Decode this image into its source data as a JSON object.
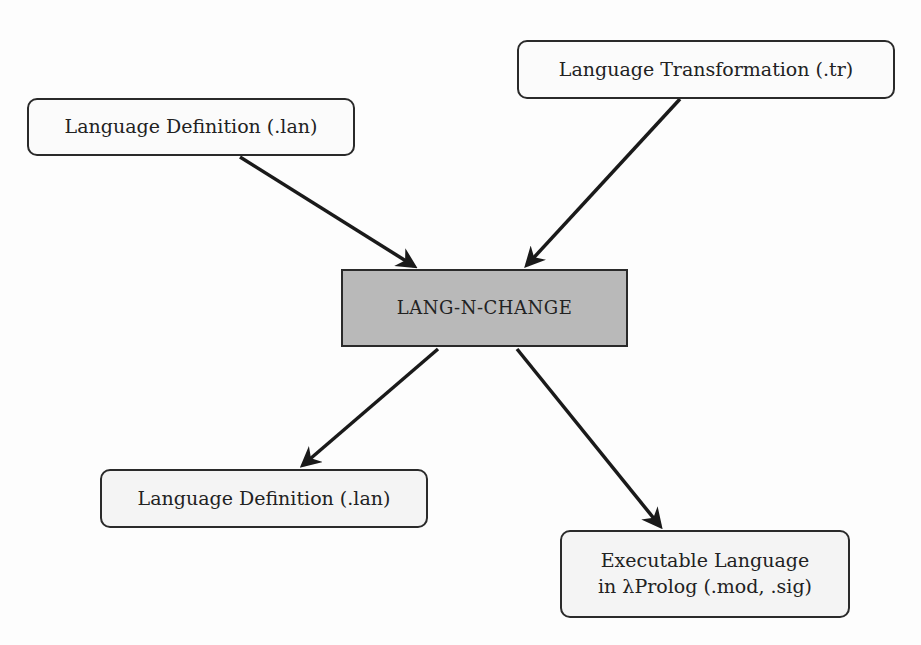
{
  "diagram": {
    "nodes": {
      "lan_input": {
        "label": "Language Definition (.lan)"
      },
      "tr_input": {
        "label": "Language Transformation (.tr)"
      },
      "core": {
        "label": "LANG-N-CHANGE"
      },
      "lan_output": {
        "label": "Language Definition (.lan)"
      },
      "exec_output": {
        "label": "Executable Language\nin λProlog (.mod, .sig)"
      }
    },
    "edges": [
      {
        "from": "lan_input",
        "to": "core"
      },
      {
        "from": "tr_input",
        "to": "core"
      },
      {
        "from": "core",
        "to": "lan_output"
      },
      {
        "from": "core",
        "to": "exec_output"
      }
    ],
    "colors": {
      "core_fill": "#b9b9b9",
      "node_fill": "#f4f4f4",
      "stroke": "#2a2a2a"
    }
  }
}
